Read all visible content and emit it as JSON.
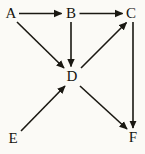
{
  "figure": {
    "background_color": "#fbfaf6",
    "ink_color": "#1a1812",
    "width": 145,
    "height": 154
  },
  "graph": {
    "type": "directed-graph",
    "nodes": [
      {
        "id": "A",
        "label": "A",
        "x": 11,
        "y": 14
      },
      {
        "id": "B",
        "label": "B",
        "x": 71,
        "y": 14
      },
      {
        "id": "C",
        "label": "C",
        "x": 131,
        "y": 14
      },
      {
        "id": "D",
        "label": "D",
        "x": 72,
        "y": 77
      },
      {
        "id": "E",
        "label": "E",
        "x": 13,
        "y": 139
      },
      {
        "id": "F",
        "label": "F",
        "x": 133,
        "y": 138
      }
    ],
    "edges": [
      {
        "id": "A-B",
        "from": "A",
        "to": "B",
        "direction": "right"
      },
      {
        "id": "B-C",
        "from": "B",
        "to": "C",
        "direction": "right"
      },
      {
        "id": "A-D",
        "from": "A",
        "to": "D",
        "direction": "down-right"
      },
      {
        "id": "B-D",
        "from": "B",
        "to": "D",
        "direction": "down"
      },
      {
        "id": "D-C",
        "from": "D",
        "to": "C",
        "direction": "up-right"
      },
      {
        "id": "E-D",
        "from": "E",
        "to": "D",
        "direction": "up-right"
      },
      {
        "id": "D-F",
        "from": "D",
        "to": "F",
        "direction": "down-right"
      },
      {
        "id": "C-F",
        "from": "C",
        "to": "F",
        "direction": "down"
      }
    ]
  }
}
